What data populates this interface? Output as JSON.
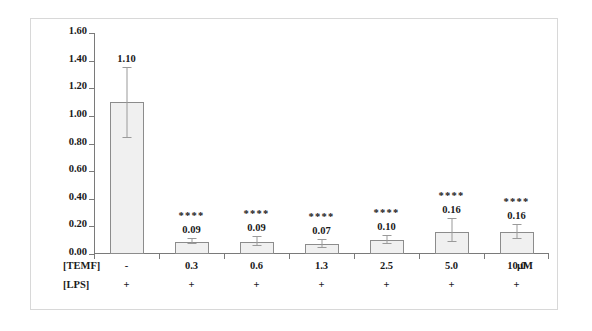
{
  "chart_data": {
    "type": "bar",
    "title": "",
    "xlabel": "",
    "ylabel": "NFκB mRNA EXPRESSION",
    "ylim": [
      0.0,
      1.6
    ],
    "ytick_labels": [
      "0.00",
      "0.20",
      "0.40",
      "0.60",
      "0.80",
      "1.00",
      "1.20",
      "1.40",
      "1.60"
    ],
    "ytick_values": [
      0.0,
      0.2,
      0.4,
      0.6,
      0.8,
      1.0,
      1.2,
      1.4,
      1.6
    ],
    "grid": false,
    "legend": "none",
    "categories": [
      "-",
      "0.3",
      "0.6",
      "1.3",
      "2.5",
      "5.0",
      "10.0"
    ],
    "values": [
      1.1,
      0.09,
      0.09,
      0.07,
      0.1,
      0.16,
      0.16
    ],
    "value_labels": [
      "1.10",
      "0.09",
      "0.09",
      "0.07",
      "0.10",
      "0.16",
      "0.16"
    ],
    "errors_low": [
      0.26,
      0.02,
      0.03,
      0.03,
      0.03,
      0.07,
      0.05
    ],
    "errors_high": [
      0.25,
      0.02,
      0.03,
      0.03,
      0.03,
      0.09,
      0.05
    ],
    "significance": [
      "",
      "****",
      "****",
      "****",
      "****",
      "****",
      "****"
    ],
    "bar_fill_color": "#f0f0f0",
    "bar_edge_color": "#8c8c8c",
    "error_bar_color": "#9a9a9a",
    "axis_color": "#7a7a7a"
  },
  "conditions": {
    "rows": [
      {
        "name": "[TEMF]",
        "cells": [
          "-",
          "0.3",
          "0.6",
          "1.3",
          "2.5",
          "5.0",
          "10.0"
        ],
        "unit": "µM"
      },
      {
        "name": "[LPS]",
        "cells": [
          "+",
          "+",
          "+",
          "+",
          "+",
          "+",
          "+"
        ],
        "unit": ""
      }
    ]
  }
}
